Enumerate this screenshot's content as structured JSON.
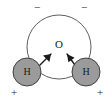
{
  "figure": {
    "name": "water-molecule-polarity-diagram",
    "background_color": "#ffffff",
    "width": 112,
    "height": 108
  },
  "atoms": {
    "oxygen": {
      "label": "O",
      "label_x": 59,
      "label_y": 45,
      "font_size": 11,
      "circle_cx": 59,
      "circle_cy": 47,
      "circle_r": 32,
      "fill": "#ffffff",
      "stroke": "#4d4d4d",
      "stroke_width": 0.9
    },
    "hydrogen_left": {
      "label": "H",
      "label_x": 27,
      "label_y": 72,
      "font_size": 10,
      "circle_cx": 27,
      "circle_cy": 72,
      "circle_r": 14,
      "fill": "#9b9b9b",
      "stroke": "#333333",
      "stroke_width": 0.9
    },
    "hydrogen_right": {
      "label": "H",
      "label_x": 86,
      "label_y": 72,
      "font_size": 10,
      "circle_cx": 86,
      "circle_cy": 72,
      "circle_r": 14,
      "fill": "#9b9b9b",
      "stroke": "#333333",
      "stroke_width": 0.9
    }
  },
  "charges": {
    "minus_left": {
      "symbol": "−",
      "x": 37,
      "y": 8,
      "font_size": 11
    },
    "minus_right": {
      "symbol": "−",
      "x": 84,
      "y": 8,
      "font_size": 11
    },
    "plus_left": {
      "symbol": "+",
      "x": 14,
      "y": 93,
      "font_size": 11
    },
    "plus_right": {
      "symbol": "+",
      "x": 100,
      "y": 93,
      "font_size": 11
    }
  },
  "dipole_arrows": {
    "stroke": "#1a1a1a",
    "stroke_width": 1.4,
    "left": {
      "x1": 33,
      "y1": 72,
      "x2": 51,
      "y2": 54,
      "head": "51,54 43.0,55.6 49.4,62.0"
    },
    "right": {
      "x1": 80,
      "y1": 72,
      "x2": 67,
      "y2": 54,
      "head": "67,54 68.4,62.3 74.6,57.8"
    }
  },
  "colors": {
    "outline": "#4d4d4d",
    "atom_fill": "#9b9b9b",
    "text": "#1a1a1a",
    "background": "#ffffff"
  }
}
